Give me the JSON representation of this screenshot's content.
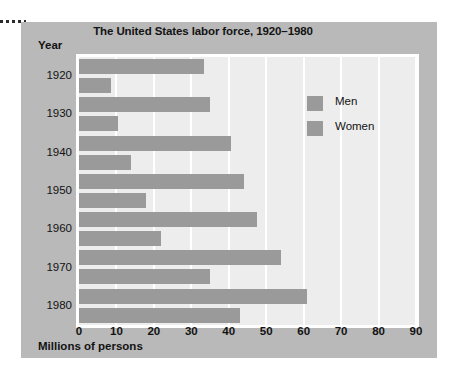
{
  "chart_data": {
    "type": "bar",
    "orientation": "horizontal",
    "title": "The United States labor force, 1920–1980",
    "xlabel": "Millions of persons",
    "ylabel": "Year",
    "xlim": [
      0,
      90
    ],
    "xticks": [
      "0",
      "10",
      "20",
      "30",
      "40",
      "50",
      "60",
      "70",
      "80",
      "90"
    ],
    "categories": [
      "1920",
      "1930",
      "1940",
      "1950",
      "1960",
      "1970",
      "1980"
    ],
    "grid": "vertical-white-gridlines",
    "legend_position": "upper-right-inside",
    "series": [
      {
        "name": "Men",
        "values": [
          33.5,
          35,
          40.5,
          44,
          47.5,
          54,
          61
        ]
      },
      {
        "name": "Women",
        "values": [
          8.5,
          10.5,
          14,
          18,
          22,
          35,
          43
        ]
      }
    ],
    "colors": {
      "bar": "#9a9a9a",
      "plot_background": "#ededed",
      "panel_background": "#b9b9b9",
      "gridline": "#ffffff",
      "text": "#131313"
    }
  },
  "legend": {
    "items": [
      {
        "label": "Men"
      },
      {
        "label": "Women"
      }
    ]
  }
}
